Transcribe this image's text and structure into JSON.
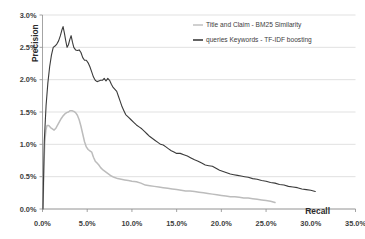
{
  "chart_data": {
    "type": "line",
    "title": "",
    "xlabel": "Recall",
    "ylabel": "Precision",
    "xlim": [
      0,
      35
    ],
    "ylim": [
      0,
      3.0
    ],
    "grid": true,
    "legend_position": "top-right",
    "x_tick_labels": [
      "0.0%",
      "5.0%",
      "10.0%",
      "15.0%",
      "20.0%",
      "25.0%",
      "30.0%",
      "35.0%"
    ],
    "x_tick_values": [
      0,
      5,
      10,
      15,
      20,
      25,
      30,
      35
    ],
    "y_tick_labels": [
      "0.0%",
      "0.5%",
      "1.0%",
      "1.5%",
      "2.0%",
      "2.5%",
      "3.0%"
    ],
    "y_tick_values": [
      0,
      0.5,
      1.0,
      1.5,
      2.0,
      2.5,
      3.0
    ],
    "series": [
      {
        "name": "Title and Claim - BM25 Similarity",
        "color": "#bcbcbc",
        "points": [
          [
            0.05,
            0.0
          ],
          [
            0.15,
            0.62
          ],
          [
            0.25,
            1.02
          ],
          [
            0.38,
            1.22
          ],
          [
            0.5,
            1.29
          ],
          [
            0.7,
            1.29
          ],
          [
            0.9,
            1.26
          ],
          [
            1.1,
            1.24
          ],
          [
            1.3,
            1.22
          ],
          [
            1.5,
            1.25
          ],
          [
            1.7,
            1.3
          ],
          [
            1.9,
            1.35
          ],
          [
            2.1,
            1.4
          ],
          [
            2.3,
            1.44
          ],
          [
            2.5,
            1.47
          ],
          [
            2.7,
            1.49
          ],
          [
            2.9,
            1.5
          ],
          [
            3.1,
            1.52
          ],
          [
            3.3,
            1.52
          ],
          [
            3.5,
            1.51
          ],
          [
            3.7,
            1.49
          ],
          [
            3.9,
            1.45
          ],
          [
            4.1,
            1.38
          ],
          [
            4.3,
            1.28
          ],
          [
            4.5,
            1.16
          ],
          [
            4.7,
            1.04
          ],
          [
            4.9,
            0.96
          ],
          [
            5.1,
            0.92
          ],
          [
            5.3,
            0.9
          ],
          [
            5.5,
            0.88
          ],
          [
            5.7,
            0.8
          ],
          [
            5.9,
            0.74
          ],
          [
            6.1,
            0.71
          ],
          [
            6.3,
            0.68
          ],
          [
            6.5,
            0.64
          ],
          [
            6.8,
            0.6
          ],
          [
            7.1,
            0.57
          ],
          [
            7.4,
            0.54
          ],
          [
            7.7,
            0.51
          ],
          [
            8.0,
            0.49
          ],
          [
            8.4,
            0.47
          ],
          [
            8.8,
            0.46
          ],
          [
            9.2,
            0.45
          ],
          [
            9.6,
            0.44
          ],
          [
            10.0,
            0.43
          ],
          [
            10.5,
            0.42
          ],
          [
            11.0,
            0.4
          ],
          [
            11.5,
            0.37
          ],
          [
            12.0,
            0.36
          ],
          [
            12.5,
            0.35
          ],
          [
            13.0,
            0.34
          ],
          [
            13.5,
            0.33
          ],
          [
            14.0,
            0.32
          ],
          [
            14.5,
            0.31
          ],
          [
            15.0,
            0.3
          ],
          [
            15.5,
            0.29
          ],
          [
            16.0,
            0.28
          ],
          [
            16.5,
            0.28
          ],
          [
            17.0,
            0.27
          ],
          [
            17.5,
            0.26
          ],
          [
            18.0,
            0.25
          ],
          [
            18.5,
            0.24
          ],
          [
            19.0,
            0.23
          ],
          [
            19.5,
            0.22
          ],
          [
            20.0,
            0.21
          ],
          [
            20.5,
            0.2
          ],
          [
            21.0,
            0.19
          ],
          [
            21.5,
            0.19
          ],
          [
            22.0,
            0.18
          ],
          [
            22.5,
            0.17
          ],
          [
            23.0,
            0.17
          ],
          [
            23.5,
            0.16
          ],
          [
            24.0,
            0.15
          ],
          [
            24.5,
            0.14
          ],
          [
            25.0,
            0.13
          ],
          [
            25.5,
            0.12
          ],
          [
            26.0,
            0.1
          ]
        ]
      },
      {
        "name": "queries Keywords - TF-IDF boosting",
        "color": "#3b3b3b",
        "points": [
          [
            0.05,
            0.0
          ],
          [
            0.2,
            1.05
          ],
          [
            0.4,
            1.6
          ],
          [
            0.6,
            1.95
          ],
          [
            0.8,
            2.2
          ],
          [
            1.0,
            2.38
          ],
          [
            1.2,
            2.5
          ],
          [
            1.4,
            2.52
          ],
          [
            1.6,
            2.55
          ],
          [
            1.8,
            2.6
          ],
          [
            2.0,
            2.68
          ],
          [
            2.15,
            2.76
          ],
          [
            2.3,
            2.82
          ],
          [
            2.45,
            2.72
          ],
          [
            2.6,
            2.6
          ],
          [
            2.75,
            2.5
          ],
          [
            2.9,
            2.54
          ],
          [
            3.05,
            2.62
          ],
          [
            3.2,
            2.68
          ],
          [
            3.35,
            2.58
          ],
          [
            3.5,
            2.5
          ],
          [
            3.7,
            2.46
          ],
          [
            3.9,
            2.45
          ],
          [
            4.1,
            2.46
          ],
          [
            4.3,
            2.42
          ],
          [
            4.5,
            2.34
          ],
          [
            4.7,
            2.3
          ],
          [
            4.9,
            2.3
          ],
          [
            5.1,
            2.26
          ],
          [
            5.3,
            2.2
          ],
          [
            5.5,
            2.12
          ],
          [
            5.7,
            2.04
          ],
          [
            5.9,
            1.99
          ],
          [
            6.1,
            1.97
          ],
          [
            6.3,
            1.98
          ],
          [
            6.5,
            1.99
          ],
          [
            6.7,
            1.99
          ],
          [
            6.9,
            2.02
          ],
          [
            7.1,
            1.98
          ],
          [
            7.3,
            2.02
          ],
          [
            7.5,
            1.99
          ],
          [
            7.7,
            1.93
          ],
          [
            7.9,
            1.88
          ],
          [
            8.1,
            1.85
          ],
          [
            8.3,
            1.82
          ],
          [
            8.5,
            1.74
          ],
          [
            8.7,
            1.66
          ],
          [
            8.9,
            1.58
          ],
          [
            9.1,
            1.52
          ],
          [
            9.3,
            1.46
          ],
          [
            9.6,
            1.42
          ],
          [
            9.9,
            1.38
          ],
          [
            10.2,
            1.34
          ],
          [
            10.5,
            1.3
          ],
          [
            10.8,
            1.27
          ],
          [
            11.1,
            1.24
          ],
          [
            11.4,
            1.2
          ],
          [
            11.7,
            1.16
          ],
          [
            12.0,
            1.12
          ],
          [
            12.3,
            1.09
          ],
          [
            12.6,
            1.06
          ],
          [
            12.9,
            1.03
          ],
          [
            13.2,
            1.0
          ],
          [
            13.5,
            0.99
          ],
          [
            13.8,
            0.96
          ],
          [
            14.1,
            0.93
          ],
          [
            14.4,
            0.9
          ],
          [
            14.7,
            0.88
          ],
          [
            15.0,
            0.86
          ],
          [
            15.4,
            0.86
          ],
          [
            15.8,
            0.84
          ],
          [
            16.2,
            0.82
          ],
          [
            16.6,
            0.79
          ],
          [
            17.0,
            0.76
          ],
          [
            17.4,
            0.74
          ],
          [
            17.8,
            0.71
          ],
          [
            18.2,
            0.68
          ],
          [
            18.6,
            0.67
          ],
          [
            19.0,
            0.66
          ],
          [
            19.4,
            0.63
          ],
          [
            19.8,
            0.6
          ],
          [
            20.2,
            0.58
          ],
          [
            20.6,
            0.56
          ],
          [
            21.0,
            0.54
          ],
          [
            21.4,
            0.53
          ],
          [
            21.8,
            0.52
          ],
          [
            22.2,
            0.51
          ],
          [
            22.6,
            0.5
          ],
          [
            23.0,
            0.49
          ],
          [
            23.5,
            0.47
          ],
          [
            24.0,
            0.46
          ],
          [
            24.5,
            0.44
          ],
          [
            25.0,
            0.43
          ],
          [
            25.5,
            0.41
          ],
          [
            26.0,
            0.4
          ],
          [
            26.5,
            0.38
          ],
          [
            27.0,
            0.37
          ],
          [
            27.5,
            0.35
          ],
          [
            28.0,
            0.34
          ],
          [
            28.5,
            0.33
          ],
          [
            29.0,
            0.31
          ],
          [
            29.5,
            0.3
          ],
          [
            30.0,
            0.29
          ],
          [
            30.5,
            0.27
          ]
        ]
      }
    ]
  },
  "legend": {
    "items": [
      {
        "label": "Title and Claim - BM25 Similarity",
        "color": "#bcbcbc"
      },
      {
        "label": "queries Keywords - TF-IDF boosting",
        "color": "#3b3b3b"
      }
    ]
  },
  "axes": {
    "x_title": "Recall",
    "y_title": "Precision"
  }
}
